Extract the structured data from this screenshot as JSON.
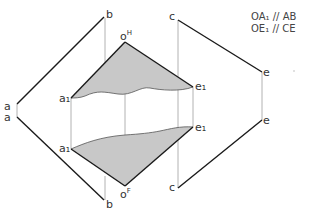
{
  "diagram": {
    "type": "descriptive-geometry-projection",
    "notes": [
      "OA₁ // AB",
      "OE₁ // CE"
    ],
    "labels": {
      "b_top": "b",
      "b_bottom": "b",
      "a_top": "a",
      "a_bottom": "a",
      "c_top": "c",
      "c_bottom": "c",
      "e_top": "e",
      "e_bottom": "e",
      "a1_top": "a₁",
      "a1_bottom": "a₁",
      "e1_top": "e₁",
      "e1_bottom": "e₁",
      "o_top": "o",
      "o_top_sup": "H",
      "o_bottom": "o",
      "o_bottom_sup": "F"
    },
    "colors": {
      "line": "#1a1a1a",
      "projector": "#999999",
      "fill": "#c8c8c8",
      "text": "#333333"
    }
  }
}
